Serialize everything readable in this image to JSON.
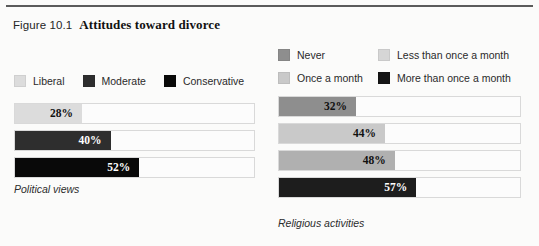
{
  "figure": {
    "label": "Figure 10.1",
    "headline": "Attitudes toward divorce"
  },
  "colors": {
    "liberal": "#dcdcdc",
    "moderate": "#2e2e2e",
    "conservative": "#090909",
    "never": "#8e8e8e",
    "once_a_month": "#c9c9c9",
    "less_than_once_a_month": "#d6d6d6",
    "more_than_once_a_month": "#151515",
    "track_background": "#fcfcfc",
    "track_border": "#d9d9d9",
    "rule": "#5b5b5b",
    "page_background": "#fbfbfa"
  },
  "legends": {
    "political": {
      "items": [
        {
          "label": "Liberal",
          "swatch": "#dcdcdc"
        },
        {
          "label": "Moderate",
          "swatch": "#2e2e2e"
        },
        {
          "label": "Conservative",
          "swatch": "#090909"
        }
      ]
    },
    "religious": {
      "rows": [
        [
          {
            "label": "Never",
            "swatch": "#8e8e8e"
          },
          {
            "label": "Less than once a month",
            "swatch": "#d6d6d6"
          }
        ],
        [
          {
            "label": "Once a month",
            "swatch": "#c9c9c9"
          },
          {
            "label": "More than once a month",
            "swatch": "#151515"
          }
        ]
      ]
    }
  },
  "captions": {
    "political": "Political views",
    "religious": "Religious activities"
  },
  "chart_data": [
    {
      "type": "bar",
      "orientation": "horizontal",
      "title": "Political views",
      "xlabel": "",
      "ylabel": "",
      "xlim": [
        0,
        100
      ],
      "grid": false,
      "legend_position": "top-left",
      "value_suffix": "%",
      "categories": [
        "Liberal",
        "Moderate",
        "Conservative"
      ],
      "values": [
        28,
        40,
        52
      ],
      "value_labels": [
        "28%",
        "40%",
        "52%"
      ],
      "bar_colors": [
        "#dcdcdc",
        "#2e2e2e",
        "#090909"
      ],
      "label_colors": [
        "#111111",
        "#ffffff",
        "#ffffff"
      ]
    },
    {
      "type": "bar",
      "orientation": "horizontal",
      "title": "Religious activities",
      "xlabel": "",
      "ylabel": "",
      "xlim": [
        0,
        100
      ],
      "grid": false,
      "legend_position": "top",
      "value_suffix": "%",
      "categories": [
        "Never",
        "Once a month",
        "Less than once a month",
        "More than once a month"
      ],
      "values": [
        32,
        44,
        48,
        57
      ],
      "value_labels": [
        "32%",
        "44%",
        "48%",
        "57%"
      ],
      "bar_colors": [
        "#8e8e8e",
        "#c9c9c9",
        "#b0b0b0",
        "#1d1d1d"
      ],
      "label_colors": [
        "#111111",
        "#111111",
        "#111111",
        "#ffffff"
      ]
    }
  ]
}
